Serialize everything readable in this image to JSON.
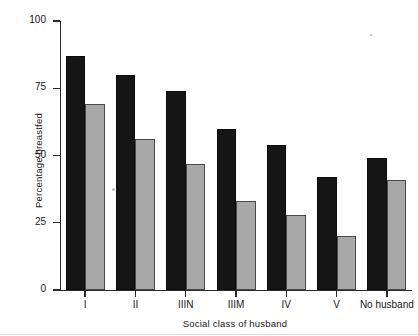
{
  "chart_data": {
    "type": "bar",
    "title": "",
    "subtitle": "",
    "xlabel": "Social class of husband",
    "ylabel": "Percentage breastfed",
    "categories": [
      "I",
      "II",
      "IIIN",
      "IIIM",
      "IV",
      "V",
      "No husband"
    ],
    "series": [
      {
        "name": "dark",
        "color": "#151515",
        "values": [
          87,
          80,
          74,
          60,
          54,
          42,
          49
        ]
      },
      {
        "name": "light",
        "color": "#a8a8a8",
        "values": [
          69,
          56,
          47,
          33,
          28,
          20,
          41
        ]
      }
    ],
    "ylim": [
      0,
      100
    ],
    "yticks": [
      0,
      25,
      50,
      75,
      100
    ],
    "ytick_labels": [
      "0",
      "25",
      "50",
      "75",
      "100"
    ],
    "grid": false,
    "legend": "none",
    "legend_position": "none"
  },
  "axes": {
    "y_label": "Percentage breastfed",
    "x_label": "Social class of husband"
  },
  "colors": {
    "dark_bar": "#151515",
    "light_bar": "#a8a8a8",
    "axis": "#2b2b2b",
    "background": "#ffffff",
    "text": "#1a1a1a"
  }
}
